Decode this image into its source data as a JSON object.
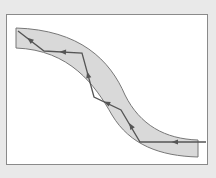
{
  "diagram": {
    "type": "optical-fiber-total-internal-reflection",
    "colors": {
      "background": "#e9e9e9",
      "frame_fill": "#ffffff",
      "frame_border": "#8a8a8a",
      "fiber_fill": "#d9d9d9",
      "fiber_edge": "#777777",
      "ray": "#555555"
    },
    "fiber": {
      "path": "M16,28 C80,30 110,60 125,95 C140,125 165,139 198,140 L198,157 C160,156 130,145 112,115 C95,85 70,50 16,48 Z"
    },
    "ray": {
      "points": "206,142 140,142 121,110 94,97 82,53 44,51 18,31",
      "arrows": [
        {
          "x": 175,
          "y": 142,
          "angle": 180
        },
        {
          "x": 131,
          "y": 126,
          "angle": 238
        },
        {
          "x": 107,
          "y": 103,
          "angle": 205
        },
        {
          "x": 88,
          "y": 75,
          "angle": 255
        },
        {
          "x": 63,
          "y": 52,
          "angle": 183
        },
        {
          "x": 30,
          "y": 40,
          "angle": 218
        }
      ]
    }
  }
}
